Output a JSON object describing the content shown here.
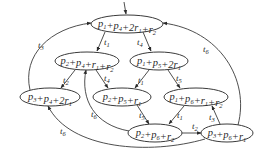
{
  "diagram": {
    "title": "",
    "nodes": [
      {
        "id": "n1",
        "label": "p1+p4+2r1+r2",
        "parts": [
          [
            "p",
            "1"
          ],
          [
            "+p",
            "4"
          ],
          [
            "+2r",
            "1"
          ],
          [
            "+r",
            "2"
          ]
        ],
        "cx": 127,
        "cy": 24,
        "rx": 36,
        "ry": 9
      },
      {
        "id": "n2",
        "label": "p2+p4+r1+r2",
        "parts": [
          [
            "p",
            "2"
          ],
          [
            "+p",
            "4"
          ],
          [
            "+r",
            "1"
          ],
          [
            "+r",
            "2"
          ]
        ],
        "cx": 87,
        "cy": 61,
        "rx": 32,
        "ry": 9
      },
      {
        "id": "n3",
        "label": "p1+p5+2r1",
        "parts": [
          [
            "p",
            "1"
          ],
          [
            "+p",
            "5"
          ],
          [
            "+2r",
            "1"
          ]
        ],
        "cx": 159,
        "cy": 61,
        "rx": 29,
        "ry": 9
      },
      {
        "id": "n4",
        "label": "p3+p4+2r1",
        "parts": [
          [
            "p",
            "3"
          ],
          [
            "+p",
            "4"
          ],
          [
            "+2r",
            "1"
          ]
        ],
        "cx": 50,
        "cy": 97,
        "rx": 30,
        "ry": 9
      },
      {
        "id": "n5",
        "label": "p2+p5+r1",
        "parts": [
          [
            "p",
            "2"
          ],
          [
            "+p",
            "5"
          ],
          [
            "+r",
            "1"
          ]
        ],
        "cx": 122,
        "cy": 97,
        "rx": 29,
        "ry": 9
      },
      {
        "id": "n6",
        "label": "p1+p6+r1+r2",
        "parts": [
          [
            "p",
            "1"
          ],
          [
            "+p",
            "6"
          ],
          [
            "+r",
            "1"
          ],
          [
            "+r",
            "2"
          ]
        ],
        "cx": 196,
        "cy": 97,
        "rx": 32,
        "ry": 9
      },
      {
        "id": "n7",
        "label": "p2+p6+r2",
        "parts": [
          [
            "p",
            "2"
          ],
          [
            "+p",
            "6"
          ],
          [
            "+r",
            "2"
          ]
        ],
        "cx": 155,
        "cy": 133,
        "rx": 27,
        "ry": 9
      },
      {
        "id": "n8",
        "label": "p3+p6+r1",
        "parts": [
          [
            "p",
            "3"
          ],
          [
            "+p",
            "6"
          ],
          [
            "+r",
            "1"
          ]
        ],
        "cx": 227,
        "cy": 133,
        "rx": 26,
        "ry": 9
      }
    ],
    "edges": [
      {
        "from": "entry",
        "to": "n1",
        "label": "",
        "path": "M124,2 L126,14",
        "lx": 0,
        "ly": 0
      },
      {
        "from": "n1",
        "to": "n2",
        "label": "t1",
        "path": "M105,32 L97,51",
        "lx": 104,
        "ly": 45
      },
      {
        "from": "n1",
        "to": "n3",
        "label": "t4",
        "path": "M143,32 L151,51",
        "lx": 137,
        "ly": 45
      },
      {
        "from": "n4",
        "to": "n1",
        "label": "t3",
        "path": "M30,90 C22,55 50,28 91,23",
        "lx": 38,
        "ly": 48
      },
      {
        "from": "n8",
        "to": "n1",
        "label": "t6",
        "path": "M238,125 C250,80 220,30 163,23",
        "lx": 203,
        "ly": 52
      },
      {
        "from": "n2",
        "to": "n4",
        "label": "t2",
        "path": "M75,70 L61,88",
        "lx": 63,
        "ly": 83
      },
      {
        "from": "n2",
        "to": "n5",
        "label": "t4",
        "path": "M96,70 L108,88",
        "lx": 104,
        "ly": 81
      },
      {
        "from": "n3",
        "to": "n5",
        "label": "t1",
        "path": "M149,70 L135,88",
        "lx": 138,
        "ly": 83
      },
      {
        "from": "n3",
        "to": "n6",
        "label": "t5",
        "path": "M168,70 L180,88",
        "lx": 176,
        "ly": 81
      },
      {
        "from": "n5",
        "to": "n7",
        "label": "t5",
        "path": "M137,105 L149,124",
        "lx": 139,
        "ly": 118
      },
      {
        "from": "n6",
        "to": "n7",
        "label": "t1",
        "path": "M184,106 L169,124",
        "lx": 177,
        "ly": 118
      },
      {
        "from": "n7",
        "to": "n2",
        "label": "t6",
        "path": "M129,131 C95,125 80,100 86,70",
        "lx": 91,
        "ly": 117
      },
      {
        "from": "n7",
        "to": "n8",
        "label": "t2",
        "path": "M182,133 L201,133",
        "lx": 192,
        "ly": 129
      },
      {
        "from": "n8",
        "to": "n6",
        "label": "t3",
        "path": "M220,124 L212,106",
        "lx": 209,
        "ly": 120
      },
      {
        "from": "n8",
        "to": "n4",
        "label": "t6",
        "path": "M205,139 C150,155 70,150 48,106",
        "lx": 60,
        "ly": 134
      }
    ]
  }
}
